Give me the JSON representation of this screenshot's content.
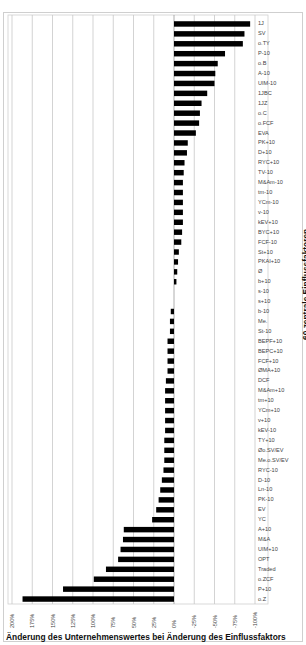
{
  "chart_data": {
    "type": "bar",
    "orientation": "horizontal",
    "title": "",
    "xlabel": "Änderung des Unternehmenswertes bei Änderung des Einflussfaktors",
    "ylabel": "60 zentrale Einflussfaktoren",
    "x_axis_reversed": true,
    "xlim": [
      200,
      -100
    ],
    "x_ticks": [
      "200%",
      "175%",
      "150%",
      "125%",
      "100%",
      "75%",
      "50%",
      "25%",
      "0%",
      "-25%",
      "-50%",
      "-75%",
      "-100%"
    ],
    "x_tick_values": [
      200,
      175,
      150,
      125,
      100,
      75,
      50,
      25,
      0,
      -25,
      -50,
      -75,
      -100
    ],
    "grid": "vertical",
    "legend": "none",
    "bar_color": "#000000",
    "categories": [
      "1J",
      "SV",
      "o.TY",
      "P-10",
      "o.B",
      "A-10",
      "UIM-10",
      "1JBC",
      "1JZ",
      "o.C",
      "o.FCF",
      "EVA",
      "PK+10",
      "D+10",
      "RYC+10",
      "TV-10",
      "M&Am-10",
      "tm-10",
      "YCm-10",
      "v-10",
      "kEV+10",
      "BYC+10",
      "FCF-10",
      "St+10",
      "PKAI+10",
      "Ø",
      "b+10",
      "s-10",
      "s+10",
      "b-10",
      "Me.",
      "St-10",
      "BEPF+10",
      "BEPC+10",
      "FCF+10",
      "ØMA+10",
      "DCF",
      "M&Am+10",
      "tm+10",
      "YCm+10",
      "v+10",
      "kEV-10",
      "TY+10",
      "Øo.SV/EV",
      "Me.o.SV/EV",
      "RYC-10",
      "D-10",
      "Ln-10",
      "PK-10",
      "EV",
      "YC",
      "A+10",
      "M&A",
      "UIM+10",
      "OPT",
      "Traded",
      "o.ZCF",
      "P+10",
      "o.Z"
    ],
    "values": [
      -94,
      -87,
      -85,
      -63,
      -54,
      -51,
      -50,
      -41,
      -34,
      -32,
      -31,
      -27,
      -17,
      -16,
      -13,
      -12,
      -11,
      -11,
      -11,
      -11,
      -11,
      -10,
      -9,
      -6,
      -5,
      -4,
      -3,
      0,
      0,
      4,
      5,
      5,
      8,
      8,
      8,
      8,
      10,
      11,
      11,
      11,
      11,
      11,
      12,
      12,
      12,
      13,
      15,
      17,
      19,
      22,
      27,
      62,
      63,
      66,
      69,
      84,
      99,
      137,
      187
    ]
  }
}
